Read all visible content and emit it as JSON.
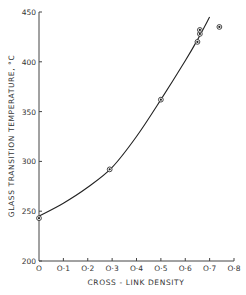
{
  "chart_data": {
    "type": "scatter",
    "title": "",
    "xlabel": "CROSS - LINK  DENSITY",
    "ylabel": "GLASS  TRANSITION  TEMPERATURE, °C",
    "xlim": [
      0,
      0.8
    ],
    "ylim": [
      200,
      450
    ],
    "x_ticks": [
      0,
      0.1,
      0.2,
      0.3,
      0.4,
      0.5,
      0.6,
      0.7,
      0.8
    ],
    "x_tick_labels": [
      "O",
      "O·1",
      "O·2",
      "O·3",
      "O·4",
      "O·5",
      "O·6",
      "O·7",
      "O·8"
    ],
    "y_ticks": [
      200,
      250,
      300,
      350,
      400,
      450
    ],
    "y_tick_labels": [
      "200",
      "250",
      "300",
      "350",
      "400",
      "450"
    ],
    "grid": false,
    "legend": null,
    "series": [
      {
        "name": "measured",
        "marker": "circled-dot",
        "points": [
          {
            "x": 0.0,
            "y": 243
          },
          {
            "x": 0.29,
            "y": 292
          },
          {
            "x": 0.5,
            "y": 362
          },
          {
            "x": 0.65,
            "y": 420
          },
          {
            "x": 0.66,
            "y": 428
          },
          {
            "x": 0.66,
            "y": 432
          },
          {
            "x": 0.74,
            "y": 435
          }
        ]
      },
      {
        "name": "fitted curve",
        "type": "line",
        "points": [
          {
            "x": 0.0,
            "y": 245
          },
          {
            "x": 0.1,
            "y": 258
          },
          {
            "x": 0.2,
            "y": 274
          },
          {
            "x": 0.3,
            "y": 294
          },
          {
            "x": 0.4,
            "y": 325
          },
          {
            "x": 0.5,
            "y": 362
          },
          {
            "x": 0.6,
            "y": 401
          },
          {
            "x": 0.65,
            "y": 422
          },
          {
            "x": 0.7,
            "y": 445
          }
        ]
      }
    ]
  }
}
